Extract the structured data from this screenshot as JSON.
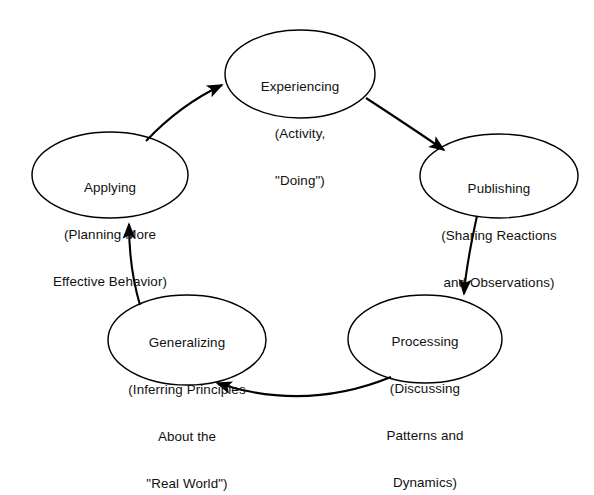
{
  "diagram": {
    "type": "cycle-diagram",
    "direction": "clockwise",
    "background_color": "#ffffff",
    "stroke_color": "#000000",
    "text_color": "#111111",
    "nodes": [
      {
        "id": "experiencing",
        "name": "Experiencing",
        "lines": [
          "Experiencing",
          "(Activity,",
          "\"Doing\")"
        ],
        "cx": 300,
        "cy": 74,
        "rx": 75,
        "ry": 44
      },
      {
        "id": "publishing",
        "name": "Publishing",
        "lines": [
          "Publishing",
          "(Sharing Reactions",
          "and Observations)"
        ],
        "cx": 499,
        "cy": 176,
        "rx": 79,
        "ry": 42
      },
      {
        "id": "processing",
        "name": "Processing",
        "lines": [
          "Processing",
          "(Discussing",
          "Patterns and",
          "Dynamics)"
        ],
        "cx": 425,
        "cy": 339,
        "rx": 77,
        "ry": 44
      },
      {
        "id": "generalizing",
        "name": "Generalizing",
        "lines": [
          "Generalizing",
          "(Inferring Principles",
          "About the",
          "\"Real World\")"
        ],
        "cx": 187,
        "cy": 340,
        "rx": 79,
        "ry": 45
      },
      {
        "id": "applying",
        "name": "Applying",
        "lines": [
          "Applying",
          "(Planning More",
          "Effective Behavior)"
        ],
        "cx": 110,
        "cy": 175,
        "rx": 78,
        "ry": 43
      }
    ],
    "arrows": [
      {
        "id": "experiencing-to-publishing",
        "from": "experiencing",
        "to": "publishing"
      },
      {
        "id": "publishing-to-processing",
        "from": "publishing",
        "to": "processing"
      },
      {
        "id": "processing-to-generalizing",
        "from": "processing",
        "to": "generalizing"
      },
      {
        "id": "generalizing-to-applying",
        "from": "generalizing",
        "to": "applying"
      },
      {
        "id": "applying-to-experiencing",
        "from": "applying",
        "to": "experiencing"
      }
    ]
  }
}
